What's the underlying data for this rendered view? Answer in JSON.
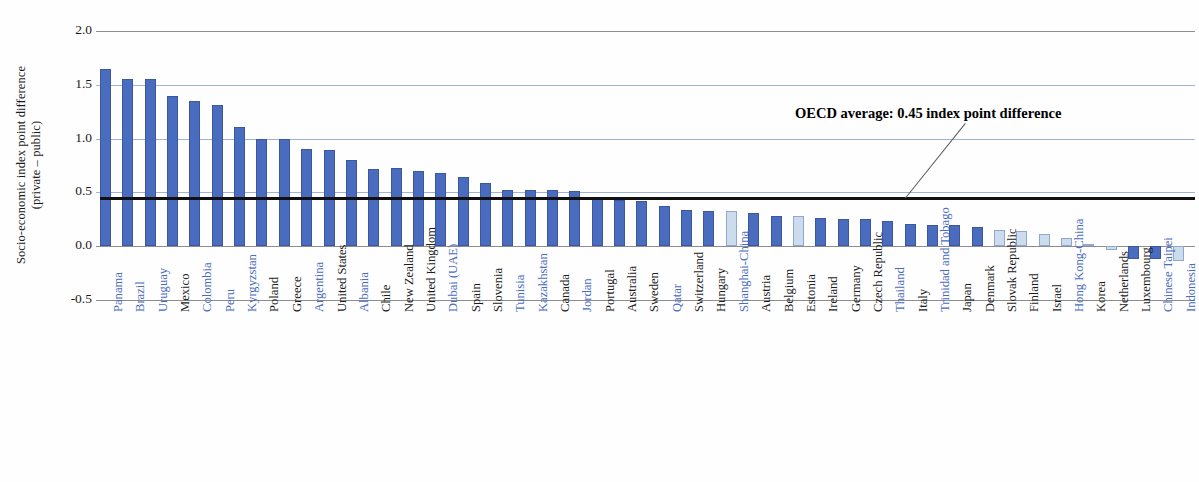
{
  "axis": {
    "y_title_line1": "Socio-economic index point difference",
    "y_title_line2": "(private – public)",
    "y_ticks": [
      "2.0",
      "1.5",
      "1.0",
      "0.5",
      "0.0",
      "-0.5"
    ],
    "y_tick_values": [
      2.0,
      1.5,
      1.0,
      0.5,
      0.0,
      -0.5
    ],
    "ylim": [
      -0.5,
      2.0
    ]
  },
  "annotation": {
    "oecd_average_text": "OECD average: 0.45 index point difference",
    "oecd_average_value": 0.45
  },
  "colors": {
    "bar_dark": "#4a6cbe",
    "bar_light": "#cddced",
    "bar_border": "#3c57a0",
    "gridline": "#9db4d8",
    "axis": "#8d8d8d",
    "label_highlight": "#4a6cbe",
    "label_default": "#1c1c1c",
    "average_line": "#111111"
  },
  "caption": "",
  "chart_data": {
    "type": "bar",
    "title": "",
    "xlabel": "",
    "ylabel": "Socio-economic index point difference (private – public)",
    "ylim": [
      -0.5,
      2.0
    ],
    "grid": true,
    "legend": "none",
    "reference_line": {
      "label": "OECD average: 0.45 index point difference",
      "value": 0.45
    },
    "categories": [
      "Panama",
      "Brazil",
      "Uruguay",
      "Mexico",
      "Colombia",
      "Peru",
      "Kyrgyzstan",
      "Poland",
      "Greece",
      "Argentina",
      "United States",
      "Albania",
      "Chile",
      "New Zealand",
      "United Kingdom",
      "Dubai (UAE)",
      "Spain",
      "Slovenia",
      "Tunisia",
      "Kazakhstan",
      "Canada",
      "Jordan",
      "Portugal",
      "Australia",
      "Sweden",
      "Qatar",
      "Switzerland",
      "Hungary",
      "Shanghai-China",
      "Austria",
      "Belgium",
      "Estonia",
      "Ireland",
      "Germany",
      "Czech Republic",
      "Thailand",
      "Italy",
      "Trinidad and Tobago",
      "Japan",
      "Denmark",
      "Slovak Republic",
      "Finland",
      "Israel",
      "Hong Kong-China",
      "Korea",
      "Netherlands",
      "Luxembourg",
      "Chinese Taipei",
      "Indonesia"
    ],
    "values": [
      1.65,
      1.55,
      1.55,
      1.4,
      1.35,
      1.31,
      1.11,
      1.0,
      1.0,
      0.9,
      0.89,
      0.8,
      0.72,
      0.73,
      0.7,
      0.68,
      0.64,
      0.59,
      0.52,
      0.52,
      0.52,
      0.51,
      0.45,
      0.43,
      0.42,
      0.37,
      0.34,
      0.33,
      0.33,
      0.31,
      0.28,
      0.28,
      0.26,
      0.25,
      0.25,
      0.23,
      0.21,
      0.2,
      0.2,
      0.18,
      0.15,
      0.14,
      0.11,
      0.08,
      0.02,
      -0.04,
      -0.12,
      -0.12,
      -0.14
    ],
    "bar_shades": [
      "dark",
      "dark",
      "dark",
      "dark",
      "dark",
      "dark",
      "dark",
      "dark",
      "dark",
      "dark",
      "dark",
      "dark",
      "dark",
      "dark",
      "dark",
      "dark",
      "dark",
      "dark",
      "dark",
      "dark",
      "dark",
      "dark",
      "dark",
      "dark",
      "dark",
      "dark",
      "dark",
      "dark",
      "light",
      "dark",
      "dark",
      "light",
      "dark",
      "dark",
      "dark",
      "dark",
      "dark",
      "dark",
      "dark",
      "dark",
      "light",
      "light",
      "light",
      "light",
      "light",
      "light",
      "dark",
      "dark",
      "light"
    ],
    "label_styles": [
      "blue",
      "blue",
      "blue",
      "black",
      "blue",
      "blue",
      "blue",
      "black",
      "black",
      "blue",
      "black",
      "blue",
      "black",
      "black",
      "black",
      "blue",
      "black",
      "black",
      "blue",
      "blue",
      "black",
      "blue",
      "black",
      "black",
      "black",
      "blue",
      "black",
      "black",
      "blue",
      "black",
      "black",
      "black",
      "black",
      "black",
      "black",
      "blue",
      "black",
      "blue",
      "black",
      "black",
      "black",
      "black",
      "black",
      "blue",
      "black",
      "black",
      "black",
      "blue",
      "blue"
    ]
  }
}
